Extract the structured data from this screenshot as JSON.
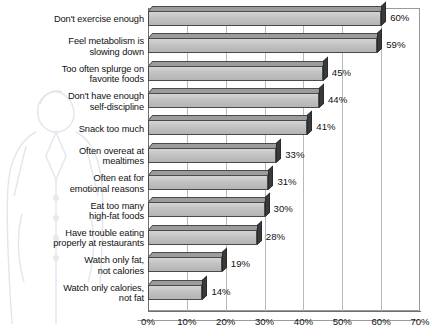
{
  "chart_data": {
    "type": "bar",
    "orientation": "horizontal",
    "title": "",
    "xlabel": "",
    "ylabel": "",
    "xlim": [
      0,
      70
    ],
    "xticks": [
      "0%",
      "10%",
      "20%",
      "30%",
      "40%",
      "50%",
      "60%",
      "70%"
    ],
    "xtick_values": [
      0,
      10,
      20,
      30,
      40,
      50,
      60,
      70
    ],
    "grid": true,
    "grid_axis": "x",
    "legend": false,
    "style": "3d-bar",
    "categories": [
      "Don't exercise enough",
      "Feel metabolism is\nslowing down",
      "Too often splurge on\nfavorite foods",
      "Don't have enough\nself-discipline",
      "Snack too much",
      "Often overeat at\nmealtimes",
      "Often eat for\nemotional reasons",
      "Eat too many\nhigh-fat foods",
      "Have trouble eating\nproperly at restaurants",
      "Watch only fat,\nnot calories",
      "Watch only calories,\nnot fat"
    ],
    "values": [
      60,
      59,
      45,
      44,
      41,
      33,
      31,
      30,
      28,
      19,
      14
    ],
    "data_labels": [
      "60%",
      "59%",
      "45%",
      "44%",
      "41%",
      "33%",
      "31%",
      "30%",
      "28%",
      "19%",
      "14%"
    ]
  },
  "colors": {
    "bar_face": "#c2c2c2",
    "bar_top": "#9c9c9c",
    "bar_side": "#3a3a3a",
    "bar_outline": "#4a4a4a",
    "gridline": "#b8b8b8",
    "axis": "#6f6f6f",
    "text": "#111111",
    "background": "#ffffff"
  }
}
